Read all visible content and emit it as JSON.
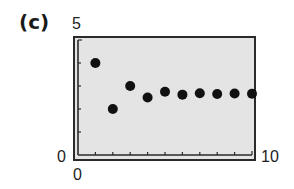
{
  "panel_label": "(c)",
  "axes": {
    "y_max_label": "5",
    "y_min_label": "0",
    "x_min_label": "0",
    "x_max_label": "10"
  },
  "chart_data": {
    "type": "scatter",
    "title": "(c)",
    "xlabel": "",
    "ylabel": "",
    "xlim": [
      0,
      10
    ],
    "ylim": [
      0,
      5
    ],
    "x_ticks": [
      1,
      2,
      3,
      4,
      5,
      6,
      7,
      8,
      9
    ],
    "y_ticks": [
      1,
      2,
      3,
      4
    ],
    "x_tick_labels": [
      "0",
      "10"
    ],
    "y_tick_labels": [
      "0",
      "5"
    ],
    "grid": false,
    "legend": null,
    "series": [
      {
        "name": "sequence",
        "x": [
          1,
          2,
          3,
          4,
          5,
          6,
          7,
          8,
          9,
          10
        ],
        "y": [
          4,
          2,
          3,
          2.5,
          2.75,
          2.625,
          2.6875,
          2.656,
          2.672,
          2.664
        ]
      }
    ],
    "colors": {
      "plot_background": "#e4e4e4",
      "frame": "#2a2a2a",
      "points": "#111111"
    }
  }
}
